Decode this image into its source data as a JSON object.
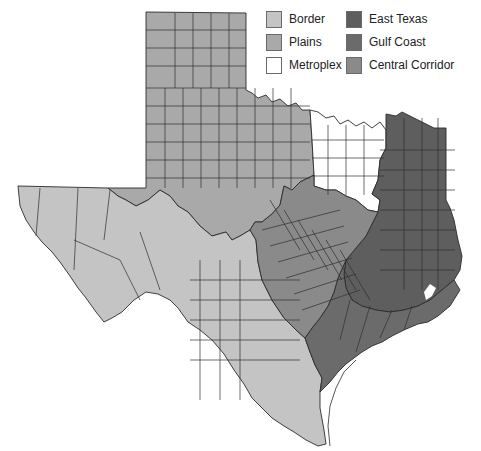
{
  "map": {
    "subject": "Texas regions by county",
    "regions": [
      {
        "key": "border",
        "name": "Border",
        "color": "#c4c4c4"
      },
      {
        "key": "plains",
        "name": "Plains",
        "color": "#a9a9a9"
      },
      {
        "key": "metroplex",
        "name": "Metroplex",
        "color": "#ffffff"
      },
      {
        "key": "east_texas",
        "name": "East Texas",
        "color": "#5e5e5e"
      },
      {
        "key": "gulf_coast",
        "name": "Gulf Coast",
        "color": "#6b6b6b"
      },
      {
        "key": "central_corridor",
        "name": "Central Corridor",
        "color": "#8a8a8a"
      }
    ]
  },
  "legend": {
    "items": [
      {
        "label": "Border",
        "color": "#c4c4c4"
      },
      {
        "label": "Plains",
        "color": "#a9a9a9"
      },
      {
        "label": "Metroplex",
        "color": "#ffffff"
      },
      {
        "label": "East Texas",
        "color": "#5e5e5e"
      },
      {
        "label": "Gulf Coast",
        "color": "#6b6b6b"
      },
      {
        "label": "Central Corridor",
        "color": "#8a8a8a"
      }
    ]
  }
}
